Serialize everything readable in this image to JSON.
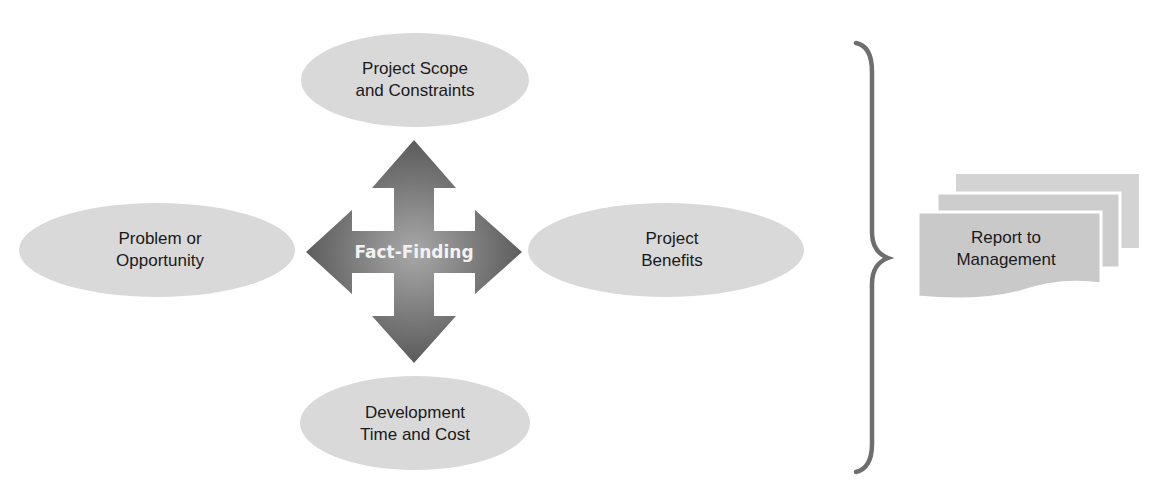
{
  "diagram": {
    "center": {
      "label": "Fact-Finding",
      "icon": "four-way-arrow-icon"
    },
    "nodes": [
      {
        "id": "top",
        "lines": [
          "Project Scope",
          "and Constraints"
        ]
      },
      {
        "id": "left",
        "lines": [
          "Problem or",
          "Opportunity"
        ]
      },
      {
        "id": "right",
        "lines": [
          "Project",
          "Benefits"
        ]
      },
      {
        "id": "bottom",
        "lines": [
          "Development",
          "Time and Cost"
        ]
      }
    ],
    "bracket": {
      "icon": "right-curly-brace-icon"
    },
    "output": {
      "lines": [
        "Report to",
        "Management"
      ],
      "icon": "document-stack-icon"
    },
    "colors": {
      "ellipse": "#d9d9d9",
      "arrow_dark": "#555555",
      "arrow_light": "#a8a8a8",
      "brace": "#6e6e6e",
      "document": "#c9c9c9"
    }
  }
}
